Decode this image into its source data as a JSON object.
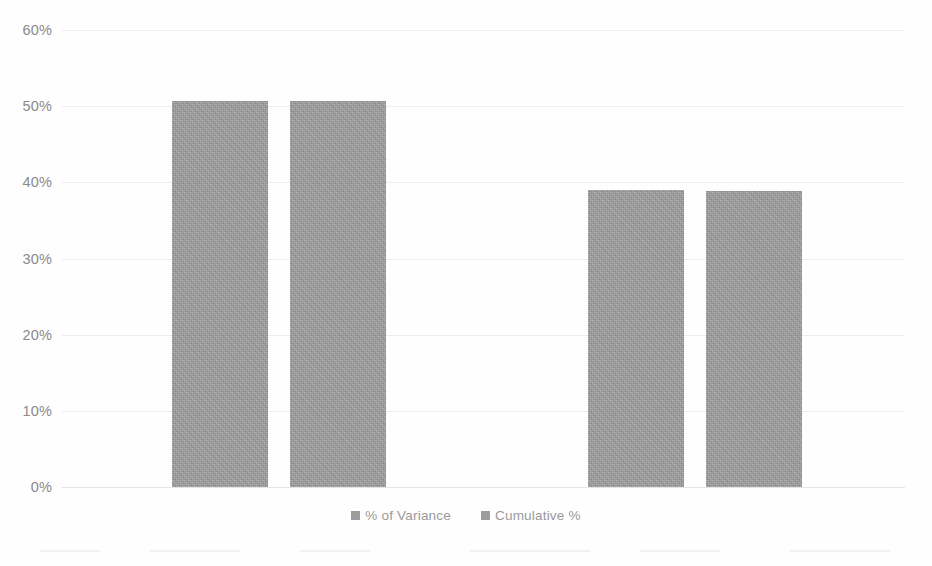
{
  "chart_data": {
    "type": "bar",
    "title": "",
    "xlabel": "",
    "ylabel": "",
    "grid": true,
    "legend_position": "bottom",
    "ylim": [
      0,
      60
    ],
    "ytick_labels": [
      "60%",
      "50%",
      "40%",
      "30%",
      "20%",
      "10%",
      "0%"
    ],
    "ytick_values": [
      60,
      50,
      40,
      30,
      20,
      10,
      0
    ],
    "categories": [
      "1",
      "2"
    ],
    "series": [
      {
        "name": "% of Variance",
        "values": [
          50.7,
          39.0
        ]
      },
      {
        "name": "Cumulative %",
        "values": [
          50.7,
          38.9
        ]
      }
    ],
    "bar_color": "#8b8b8b"
  },
  "legend": {
    "items": [
      {
        "label": "% of Variance"
      },
      {
        "label": "Cumulative %"
      }
    ]
  },
  "artifacts": {
    "clipped_top_text": ""
  }
}
